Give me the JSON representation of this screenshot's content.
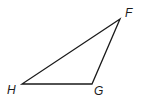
{
  "diagram": {
    "type": "triangle",
    "stroke_color": "#1a1a1a",
    "vertices": [
      {
        "name": "F",
        "x": 120,
        "y": 19,
        "label_x": 125,
        "label_y": 17
      },
      {
        "name": "H",
        "x": 22,
        "y": 84,
        "label_x": 7,
        "label_y": 94
      },
      {
        "name": "G",
        "x": 92,
        "y": 84,
        "label_x": 94,
        "label_y": 95
      }
    ],
    "sides": [
      "FH",
      "HG",
      "GF"
    ]
  }
}
